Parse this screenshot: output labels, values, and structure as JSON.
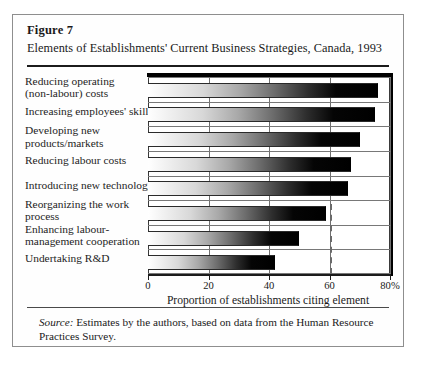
{
  "figure": {
    "number": "Figure 7",
    "title": "Elements of Establishments' Current Business Strategies, Canada, 1993",
    "source_label": "Source:",
    "source_text": "Estimates by the authors, based on data from the Human Resource Practices Survey."
  },
  "chart_data": {
    "type": "bar",
    "orientation": "horizontal",
    "title": "Elements of Establishments' Current Business Strategies, Canada, 1993",
    "xlabel": "Proportion of establishments citing element",
    "ylabel": "",
    "xlim": [
      0,
      80
    ],
    "xticks": [
      0,
      20,
      40,
      60,
      80
    ],
    "xtick_labels": [
      "0",
      "20",
      "40",
      "60",
      "80%"
    ],
    "grid": true,
    "legend": "none",
    "reference_line": {
      "value": 60,
      "style": "dashed"
    },
    "categories": [
      "Reducing operating (non-labour) costs",
      "Increasing employees' skills",
      "Developing new products/markets",
      "Reducing labour costs",
      "Introducing new technology",
      "Reorganizing the work process",
      "Enhancing labour-management cooperation",
      "Undertaking R&D"
    ],
    "values": [
      76,
      75,
      70,
      67,
      66,
      59,
      50,
      42
    ]
  },
  "labels": [
    {
      "line1": "Reducing operating",
      "line2": "(non-labour) costs"
    },
    {
      "line1": "Increasing employees' skills",
      "line2": ""
    },
    {
      "line1": "Developing new",
      "line2": "products/markets"
    },
    {
      "line1": "Reducing labour costs",
      "line2": ""
    },
    {
      "line1": "Introducing new technology",
      "line2": ""
    },
    {
      "line1": "Reorganizing the work",
      "line2": "process"
    },
    {
      "line1": "Enhancing labour-",
      "line2": "management cooperation"
    },
    {
      "line1": "Undertaking R&D",
      "line2": ""
    }
  ],
  "axis": {
    "tick_0": "0",
    "tick_20": "20",
    "tick_40": "40",
    "tick_60": "60",
    "tick_80": "80%",
    "title": "Proportion of establishments citing element"
  }
}
